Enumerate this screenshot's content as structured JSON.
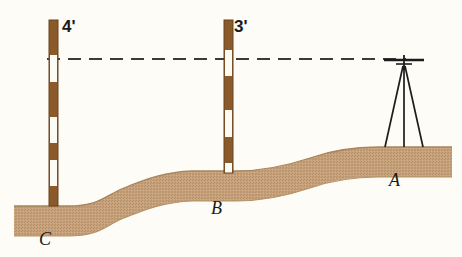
{
  "figure": {
    "kind": "surveying-leveling-diagram",
    "background_color": "#fdfcf6"
  },
  "colors": {
    "background": "#fdfcf6",
    "ground_fill": "#c6a079",
    "ground_shade": "#b08f69",
    "ground_edge": "#9c7d5c",
    "rod_brown": "#8a5a2b",
    "rod_white": "#fbfaf4",
    "rod_outline": "#5e3d1d",
    "instrument": "#1c1c1c",
    "sight_line": "#3a3a3a",
    "label_text": "#1a1a1a"
  },
  "rods": [
    {
      "id": "rod-left",
      "point": "C",
      "reading_label": "4'",
      "x": 49,
      "top_y": 20,
      "base_y": 206,
      "width": 9,
      "stripes": [
        {
          "color": "brown",
          "from": 20,
          "to": 55
        },
        {
          "color": "white",
          "from": 55,
          "to": 82
        },
        {
          "color": "brown",
          "from": 82,
          "to": 117
        },
        {
          "color": "white",
          "from": 117,
          "to": 143
        },
        {
          "color": "brown",
          "from": 143,
          "to": 160
        },
        {
          "color": "white",
          "from": 160,
          "to": 186
        },
        {
          "color": "brown",
          "from": 186,
          "to": 206
        }
      ]
    },
    {
      "id": "rod-middle",
      "point": "B",
      "reading_label": "3'",
      "x": 224,
      "top_y": 20,
      "base_y": 173,
      "width": 9,
      "stripes": [
        {
          "color": "brown",
          "from": 20,
          "to": 50
        },
        {
          "color": "white",
          "from": 50,
          "to": 76
        },
        {
          "color": "brown",
          "from": 76,
          "to": 110
        },
        {
          "color": "white",
          "from": 110,
          "to": 137
        },
        {
          "color": "brown",
          "from": 137,
          "to": 163
        },
        {
          "color": "white",
          "from": 163,
          "to": 173
        }
      ]
    }
  ],
  "sight_line": {
    "id": "line-of-sight",
    "style": "dashed",
    "y": 59,
    "x_start": 47,
    "x_end": 406,
    "dash_pattern": "13 8",
    "stroke_width": 2.2
  },
  "instrument": {
    "id": "level-on-tripod",
    "name": "surveyor-level",
    "head_x": 404,
    "head_y": 60,
    "head_half_width": 20,
    "ground_y": 147,
    "legs": [
      {
        "foot_x": 385
      },
      {
        "foot_x": 404
      },
      {
        "foot_x": 423
      }
    ]
  },
  "ground": {
    "id": "terrain-profile",
    "description": "tan textured ground band rising from C on the left to A on the right",
    "top_path": "M 14,206 L 68,206 C 100,206 104,196 124,188 C 148,178 166,172 192,171 L 236,171 C 262,171 286,166 310,158 C 336,149 356,147 378,147 L 448,147",
    "thickness": 30
  },
  "labels": {
    "height_left": "4'",
    "height_middle": "3'",
    "point_c": "C",
    "point_b": "B",
    "point_a": "A"
  }
}
